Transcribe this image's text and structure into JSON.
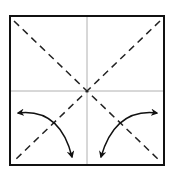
{
  "diagram": {
    "type": "origami-fold-diagram",
    "colors": {
      "border": "#111111",
      "dashed": "#222222",
      "crease": "#b0b0b0",
      "arrow": "#111111",
      "background": "#ffffff"
    },
    "elements": {
      "square": "paper-square",
      "creases": [
        "vertical-center-crease",
        "horizontal-center-crease"
      ],
      "valley_folds": [
        "diagonal-tl-br",
        "diagonal-tr-bl"
      ],
      "arrows": [
        "fold-arrow-left",
        "fold-arrow-right"
      ]
    }
  }
}
